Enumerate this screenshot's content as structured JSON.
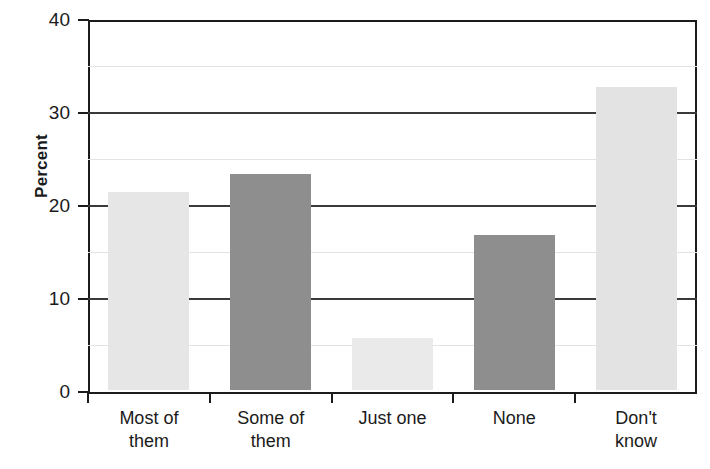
{
  "chart_data": {
    "type": "bar",
    "title": "",
    "subtitle": "",
    "xlabel": "",
    "ylabel": "Percent",
    "ylim": [
      0,
      40
    ],
    "xlim_categories": 5,
    "grid": true,
    "grid_major_values": [
      10,
      20,
      30
    ],
    "grid_minor_values": [
      5,
      15,
      25,
      35
    ],
    "legend": null,
    "y_ticks": [
      "0",
      "10",
      "20",
      "30",
      "40"
    ],
    "y_tick_values": [
      0,
      10,
      20,
      30,
      40
    ],
    "categories": [
      "Most of them",
      "Some of them",
      "Just one",
      "None",
      "Don't know"
    ],
    "category_lines": [
      [
        "Most of",
        "them"
      ],
      [
        "Some of",
        "them"
      ],
      [
        "Just one",
        ""
      ],
      [
        "None",
        ""
      ],
      [
        "Don't",
        "know"
      ]
    ],
    "values": [
      21.3,
      23.2,
      5.6,
      16.7,
      32.6
    ],
    "bar_colors": [
      "#e6e6e6",
      "#8e8e8e",
      "#eaeaea",
      "#8e8e8e",
      "#e3e3e3"
    ],
    "colors": {
      "light_bar": "#e6e6e6",
      "dark_bar": "#8e8e8e",
      "axis": "#1b1b1b",
      "gridline_major": "#3a3a3a",
      "gridline_minor": "#e3e3e3",
      "background": "#ffffff",
      "text": "#1b1b1b"
    }
  }
}
